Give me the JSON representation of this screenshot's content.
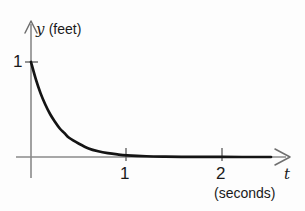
{
  "figure": {
    "background_color": "#fdfdfd",
    "axis_color": "#8a8a8a",
    "curve_color": "#141414",
    "text_color": "#1a1a1a"
  },
  "labels": {
    "y_axis_variable": "y",
    "y_axis_unit": "(feet)",
    "x_axis_variable": "t",
    "x_axis_unit": "(seconds)",
    "ytick_1": "1",
    "xtick_1": "1",
    "xtick_2": "2"
  },
  "chart_data": {
    "type": "line",
    "title": "",
    "xlabel": "t",
    "ylabel": "y",
    "xunit": "seconds",
    "yunit": "feet",
    "xlim": [
      0,
      2.7
    ],
    "ylim": [
      0,
      1.05
    ],
    "xticks": [
      1,
      2
    ],
    "xticklabels": [
      "1",
      "2"
    ],
    "yticks": [
      1
    ],
    "yticklabels": [
      "1"
    ],
    "grid": false,
    "legend": null,
    "annotations": [],
    "series": [
      {
        "name": "y(t)",
        "description": "exponential decay from y=1 at t=0 toward y=0",
        "x": [
          0,
          0.05,
          0.1,
          0.15,
          0.2,
          0.25,
          0.3,
          0.35,
          0.4,
          0.5,
          0.6,
          0.7,
          0.8,
          0.9,
          1.0,
          1.2,
          1.4,
          1.6,
          1.8,
          2.0,
          2.2,
          2.4,
          2.5
        ],
        "y": [
          1.0,
          0.82,
          0.67,
          0.55,
          0.45,
          0.37,
          0.3,
          0.25,
          0.2,
          0.14,
          0.09,
          0.06,
          0.04,
          0.027,
          0.018,
          0.008,
          0.004,
          0.002,
          0.001,
          0.0005,
          0.0002,
          0.0001,
          0.0
        ]
      }
    ]
  }
}
